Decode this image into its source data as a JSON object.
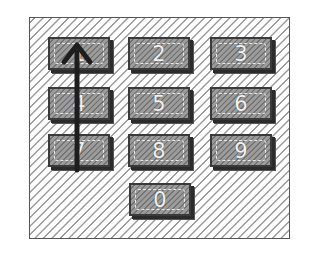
{
  "figure": {
    "keys": [
      {
        "label": "1",
        "row": 0,
        "col": 0
      },
      {
        "label": "2",
        "row": 0,
        "col": 1
      },
      {
        "label": "3",
        "row": 0,
        "col": 2
      },
      {
        "label": "4",
        "row": 1,
        "col": 0
      },
      {
        "label": "5",
        "row": 1,
        "col": 1
      },
      {
        "label": "6",
        "row": 1,
        "col": 2
      },
      {
        "label": "7",
        "row": 2,
        "col": 0
      },
      {
        "label": "8",
        "row": 2,
        "col": 1
      },
      {
        "label": "9",
        "row": 2,
        "col": 2
      },
      {
        "label": "0",
        "row": 3,
        "col": 1
      }
    ],
    "gesture": {
      "type": "swipe-up-arrow",
      "path_keys": [
        "7",
        "4",
        "1"
      ],
      "color": "#1e1e1e"
    },
    "colors": {
      "key_fill": "#8e8e8e",
      "key_border": "#3a3a3a",
      "label": "#f2f2f2",
      "hatch": "#9a9a9a",
      "frame_border": "#555555"
    }
  }
}
